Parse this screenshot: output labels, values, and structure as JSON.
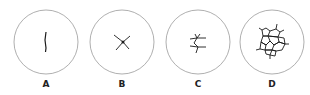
{
  "figure": {
    "panels": [
      {
        "label": "A",
        "pattern": "single-line-crack"
      },
      {
        "label": "B",
        "pattern": "cross-star-crack"
      },
      {
        "label": "C",
        "pattern": "branching-crack"
      },
      {
        "label": "D",
        "pattern": "network-crack"
      }
    ],
    "colors": {
      "circle": "#9a9a9a",
      "crack": "#1a1a1a"
    }
  }
}
